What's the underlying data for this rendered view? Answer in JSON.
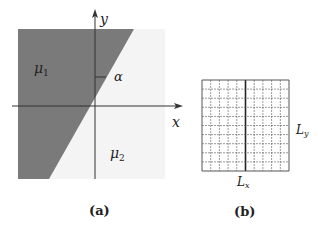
{
  "figure": {
    "panel_a": {
      "caption": "(a)",
      "axis_x_label": "x",
      "axis_y_label": "y",
      "angle_label": "α",
      "region_dark_label": "μ",
      "region_dark_sub": "1",
      "region_light_label": "μ",
      "region_light_sub": "2",
      "colors": {
        "dark_region": "#7a7a7a",
        "light_region": "#f4f4f4",
        "axis": "#333333"
      }
    },
    "panel_b": {
      "caption": "(b)",
      "label_x": "L",
      "label_x_sub": "x",
      "label_y": "L",
      "label_y_sub": "y",
      "grid_columns": 10,
      "grid_rows": 10,
      "colors": {
        "grid_line": "#555555",
        "center_line": "#222222"
      }
    }
  }
}
